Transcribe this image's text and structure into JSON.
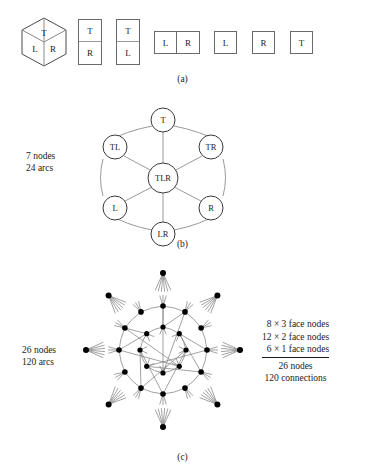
{
  "figure": {
    "panel_a": {
      "caption": "(a)",
      "cube": {
        "name": "cube-isometric",
        "faces": [
          "T",
          "L",
          "R"
        ]
      },
      "tiles": [
        {
          "id": "tile-t-r",
          "layout": "stacked-2",
          "cells": [
            "T",
            "R"
          ]
        },
        {
          "id": "tile-t-l",
          "layout": "stacked-2",
          "cells": [
            "T",
            "L"
          ]
        },
        {
          "id": "tile-l-r",
          "layout": "side-2",
          "cells": [
            "L",
            "R"
          ]
        },
        {
          "id": "tile-l",
          "layout": "single",
          "cells": [
            "L"
          ]
        },
        {
          "id": "tile-r",
          "layout": "single",
          "cells": [
            "R"
          ]
        },
        {
          "id": "tile-t",
          "layout": "single",
          "cells": [
            "T"
          ]
        }
      ]
    },
    "panel_b": {
      "caption": "(b)",
      "stats": [
        "7 nodes",
        "24 arcs"
      ],
      "nodes": [
        {
          "id": "n-t",
          "label": "T",
          "cx": 163,
          "cy": 25,
          "r": 12
        },
        {
          "id": "n-tl",
          "label": "TL",
          "cx": 115,
          "cy": 52,
          "r": 12
        },
        {
          "id": "n-tr",
          "label": "TR",
          "cx": 211,
          "cy": 52,
          "r": 12
        },
        {
          "id": "n-tlr",
          "label": "TLR",
          "cx": 163,
          "cy": 83,
          "r": 15
        },
        {
          "id": "n-l",
          "label": "L",
          "cx": 115,
          "cy": 113,
          "r": 12
        },
        {
          "id": "n-r",
          "label": "R",
          "cx": 211,
          "cy": 113,
          "r": 12
        },
        {
          "id": "n-lr",
          "label": "LR",
          "cx": 163,
          "cy": 139,
          "r": 12
        }
      ],
      "edges": [
        [
          "n-t",
          "n-tl"
        ],
        [
          "n-t",
          "n-tr"
        ],
        [
          "n-tl",
          "n-l"
        ],
        [
          "n-tr",
          "n-r"
        ],
        [
          "n-l",
          "n-lr"
        ],
        [
          "n-r",
          "n-lr"
        ],
        [
          "n-t",
          "n-tlr"
        ],
        [
          "n-tl",
          "n-tlr"
        ],
        [
          "n-tr",
          "n-tlr"
        ],
        [
          "n-l",
          "n-tlr"
        ],
        [
          "n-r",
          "n-tlr"
        ],
        [
          "n-lr",
          "n-tlr"
        ]
      ]
    },
    "panel_c": {
      "caption": "(c)",
      "stats": [
        "26 nodes",
        "120 arcs"
      ],
      "summary": {
        "lines": [
          "8 × 3 face nodes",
          "12 × 2 face nodes",
          "6 × 1 face nodes"
        ],
        "totals": [
          "26 nodes",
          "120 connections"
        ]
      },
      "rings": {
        "inner_count": 8,
        "middle_count": 12,
        "outer_count": 8
      }
    }
  },
  "colors": {
    "ink": "#1a1a1a",
    "stroke_light": "#9a9a9a",
    "stroke_box": "#6a6a6a",
    "node_fill": "#000000",
    "paper": "#ffffff"
  }
}
